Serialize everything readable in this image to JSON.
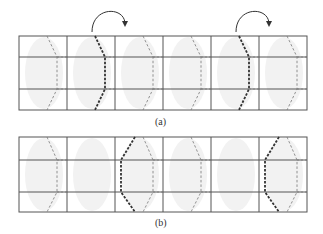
{
  "figure": {
    "panels": [
      {
        "id": "a",
        "caption": "(a)",
        "grid": {
          "x0": 19,
          "y0": 36,
          "col_width": 48,
          "cols": 6,
          "row_lines": [
            36,
            57,
            89,
            110
          ]
        },
        "fold_arrows": [
          {
            "column": 2
          },
          {
            "column": 5
          }
        ],
        "columns": [
          {
            "index": 1,
            "right_chevron": "light",
            "left_chevron": "none"
          },
          {
            "index": 2,
            "right_chevron": "heavy",
            "left_chevron": "none"
          },
          {
            "index": 3,
            "right_chevron": "light",
            "left_chevron": "none"
          },
          {
            "index": 4,
            "right_chevron": "light",
            "left_chevron": "none"
          },
          {
            "index": 5,
            "right_chevron": "heavy",
            "left_chevron": "none"
          },
          {
            "index": 6,
            "right_chevron": "light",
            "left_chevron": "none"
          }
        ]
      },
      {
        "id": "b",
        "caption": "(b)",
        "grid": {
          "x0": 19,
          "y0": 137,
          "col_width": 48,
          "cols": 6,
          "row_lines": [
            137,
            160,
            192,
            212
          ]
        },
        "fold_arrows": [],
        "columns": [
          {
            "index": 1,
            "right_chevron": "light",
            "left_chevron": "none"
          },
          {
            "index": 2,
            "right_chevron": "none",
            "left_chevron": "none"
          },
          {
            "index": 3,
            "right_chevron": "light",
            "left_chevron": "heavy"
          },
          {
            "index": 4,
            "right_chevron": "light",
            "left_chevron": "none"
          },
          {
            "index": 5,
            "right_chevron": "none",
            "left_chevron": "none"
          },
          {
            "index": 6,
            "right_chevron": "light",
            "left_chevron": "heavy"
          }
        ]
      }
    ],
    "colors": {
      "grid_line": "#555555",
      "dash_light": "#777777",
      "dash_heavy": "#333333",
      "ellipse_fill": "#f2f2f2",
      "arrow": "#333333"
    }
  }
}
